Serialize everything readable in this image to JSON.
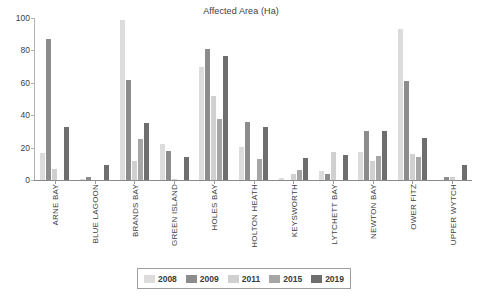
{
  "chart_data": {
    "type": "bar",
    "title": "Affected Area (Ha)",
    "xlabel": "",
    "ylabel": "",
    "ylim": [
      0,
      100
    ],
    "yticks": [
      0,
      20,
      40,
      60,
      80,
      100
    ],
    "grid": false,
    "legend_position": "bottom",
    "categories": [
      "ARNE BAY",
      "BLUE LAGOON",
      "BRANDS BAY",
      "GREEN ISLAND",
      "HOLES BAY",
      "HOLTON HEATH",
      "KEYSWORTH",
      "LYTCHETT BAY",
      "NEWTON BAY",
      "OWER FITZ",
      "UPPER WYTCH"
    ],
    "series": [
      {
        "name": "2008",
        "color": "#dcdcdc",
        "values": [
          16.5,
          0.5,
          99,
          22.5,
          69.5,
          20.5,
          1,
          5.5,
          17,
          93,
          0
        ]
      },
      {
        "name": "2009",
        "color": "#8c8c8c",
        "values": [
          87,
          2,
          61.5,
          18,
          81,
          36,
          0,
          3.5,
          30.5,
          61,
          2
        ]
      },
      {
        "name": "2011",
        "color": "#d0d0d0",
        "values": [
          7,
          0,
          12,
          0.5,
          52,
          0,
          4,
          17,
          11.5,
          16,
          1.8
        ]
      },
      {
        "name": "2015",
        "color": "#a6a6a6",
        "values": [
          0,
          0,
          25.5,
          0,
          37.5,
          13,
          6,
          0,
          15,
          14.5,
          0
        ]
      },
      {
        "name": "2019",
        "color": "#6e6e6e",
        "values": [
          32.5,
          9.5,
          35.5,
          14.5,
          76.5,
          32.5,
          13.5,
          15.5,
          30,
          26,
          9
        ]
      }
    ]
  },
  "legend": {
    "entries": [
      {
        "label": "2008"
      },
      {
        "label": "2009"
      },
      {
        "label": "2011"
      },
      {
        "label": "2015"
      },
      {
        "label": "2019"
      }
    ]
  },
  "axis": {
    "y_tick_labels": [
      "100",
      "80",
      "60",
      "40",
      "20",
      "0"
    ]
  }
}
